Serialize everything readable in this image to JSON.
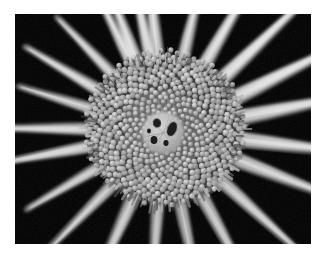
{
  "image": {
    "kind": "natural-photograph",
    "subject": "coneflower-bloom-macro",
    "description": "Black-and-white macro photograph of an echinacea / coneflower seed head seen nearly face-on, with a dense spiky central disc surrounded by long pale ray petals radiating outward against a black background.",
    "orientation": "landscape",
    "palette": "grayscale",
    "frame": {
      "page_background": "#ffffff",
      "photo_left": 15,
      "photo_top": 14,
      "photo_width": 296,
      "photo_height": 230,
      "photo_background": "#000000"
    },
    "colors": {
      "background": "#000000",
      "petal_bright": "#f4f4f4",
      "petal_mid": "#c8c8c8",
      "petal_shadow": "#6e6e6e",
      "disc_base_dark": "#2e2e2e",
      "disc_base_mid": "#5a5a5a",
      "disc_base_light": "#9a9a9a",
      "floret_tip_bright": "#e6e6e6",
      "floret_tip_mid": "#b4b4b4",
      "center_patch": "#c6c6c6",
      "center_spot_dark": "#141414"
    },
    "composition": {
      "center_x": 150,
      "center_y": 117,
      "disc_radius": 74,
      "inner_patch_radius": 21,
      "inner_patch_offset_x": -2,
      "inner_patch_offset_y": 2
    },
    "petals": [
      {
        "angle": -96,
        "length": 132,
        "width": 13,
        "brightness": 0.97,
        "taper": 0.42
      },
      {
        "angle": -76,
        "length": 126,
        "width": 12,
        "brightness": 0.93,
        "taper": 0.45
      },
      {
        "angle": -59,
        "length": 150,
        "width": 13,
        "brightness": 0.98,
        "taper": 0.4
      },
      {
        "angle": -42,
        "length": 160,
        "width": 14,
        "brightness": 1.0,
        "taper": 0.38
      },
      {
        "angle": -25,
        "length": 168,
        "width": 15,
        "brightness": 0.99,
        "taper": 0.36
      },
      {
        "angle": -10,
        "length": 164,
        "width": 15,
        "brightness": 0.96,
        "taper": 0.38
      },
      {
        "angle": 6,
        "length": 160,
        "width": 15,
        "brightness": 0.94,
        "taper": 0.4
      },
      {
        "angle": 22,
        "length": 152,
        "width": 14,
        "brightness": 0.9,
        "taper": 0.42
      },
      {
        "angle": 41,
        "length": 140,
        "width": 13,
        "brightness": 0.86,
        "taper": 0.44
      },
      {
        "angle": 60,
        "length": 130,
        "width": 13,
        "brightness": 0.82,
        "taper": 0.46
      },
      {
        "angle": 78,
        "length": 124,
        "width": 12,
        "brightness": 0.8,
        "taper": 0.48
      },
      {
        "angle": 96,
        "length": 120,
        "width": 12,
        "brightness": 0.78,
        "taper": 0.48
      },
      {
        "angle": 116,
        "length": 128,
        "width": 13,
        "brightness": 0.84,
        "taper": 0.46
      },
      {
        "angle": 134,
        "length": 122,
        "width": 12,
        "brightness": 0.86,
        "taper": 0.46
      },
      {
        "angle": 152,
        "length": 114,
        "width": 11,
        "brightness": 0.88,
        "taper": 0.48
      },
      {
        "angle": 168,
        "length": 126,
        "width": 12,
        "brightness": 0.92,
        "taper": 0.44
      },
      {
        "angle": 182,
        "length": 132,
        "width": 12,
        "brightness": 0.94,
        "taper": 0.42
      },
      {
        "angle": 197,
        "length": 108,
        "width": 11,
        "brightness": 0.9,
        "taper": 0.46
      },
      {
        "angle": 212,
        "length": 118,
        "width": 12,
        "brightness": 0.93,
        "taper": 0.44
      },
      {
        "angle": 228,
        "length": 112,
        "width": 11,
        "brightness": 0.91,
        "taper": 0.46
      },
      {
        "angle": 244,
        "length": 122,
        "width": 12,
        "brightness": 0.94,
        "taper": 0.43
      },
      {
        "angle": 259,
        "length": 128,
        "width": 12,
        "brightness": 0.95,
        "taper": 0.42
      },
      {
        "angle": -112,
        "length": 124,
        "width": 12,
        "brightness": 0.95,
        "taper": 0.44
      }
    ],
    "center_spots": [
      {
        "cx": -6,
        "cy": -10,
        "rx": 4.0,
        "ry": 4.6,
        "rot": -12
      },
      {
        "cx": 9,
        "cy": -4,
        "rx": 4.6,
        "ry": 7.5,
        "rot": 22
      },
      {
        "cx": -9,
        "cy": 7,
        "rx": 3.4,
        "ry": 3.9,
        "rot": 0
      },
      {
        "cx": 3,
        "cy": 10,
        "rx": 2.6,
        "ry": 3.0,
        "rot": 0
      },
      {
        "cx": -14,
        "cy": -2,
        "rx": 2.0,
        "ry": 2.4,
        "rot": 0
      }
    ],
    "disc_florets": {
      "spiral_turns": 13.5,
      "count": 620,
      "phyllotaxis_angle_deg": 137.507,
      "tip_min_radius": 1.1,
      "tip_max_radius": 3.4
    }
  }
}
